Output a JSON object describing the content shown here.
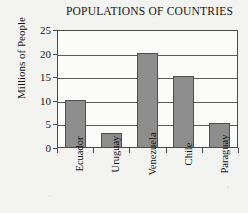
{
  "chart_data": {
    "type": "bar",
    "title": "POPULATIONS OF COUNTRIES",
    "xlabel": "",
    "ylabel": "Millions of People",
    "categories": [
      "Ecuador",
      "Uruguay",
      "Venezuela",
      "Chile",
      "Paraguay"
    ],
    "values": [
      10,
      3,
      20,
      15,
      5
    ],
    "ylim": [
      0,
      25
    ],
    "yticks": [
      0,
      5,
      10,
      15,
      20,
      25
    ],
    "grid": true,
    "legend": false,
    "colors": {
      "bar_fill": "#8d8d8d",
      "bar_outline": "#4f4f4f",
      "gridline": "#5a5a5a",
      "axis": "#4a4a4a",
      "plot_background": "#fbfbfa",
      "page_background": "#f3f3f1",
      "text": "#141414"
    }
  }
}
